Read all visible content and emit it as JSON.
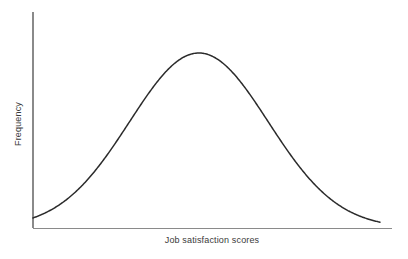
{
  "chart_data": {
    "type": "line",
    "title": "",
    "subtitle": "",
    "xlabel": "Job satisfaction scores",
    "ylabel": "Frequency",
    "annotations": [],
    "legend": [],
    "legend_position": "none",
    "grid": false,
    "xticks": [],
    "yticks": [],
    "xtick_labels": [],
    "ytick_labels": [],
    "xlim": [
      0,
      1
    ],
    "ylim": [
      0,
      1
    ],
    "distribution": "normal",
    "mean": 0.478,
    "stdev": 0.2,
    "peak_value": 1.0,
    "curve_color": "#2b2b2b",
    "axis_color": "#8a8a8a",
    "background_color": "#ffffff",
    "x": [
      0.0,
      0.04,
      0.08,
      0.12,
      0.16,
      0.2,
      0.24,
      0.28,
      0.32,
      0.36,
      0.4,
      0.44,
      0.48,
      0.52,
      0.56,
      0.6,
      0.64,
      0.68,
      0.72,
      0.76,
      0.8,
      0.84,
      0.88,
      0.92,
      0.96,
      1.0
    ],
    "y": [
      0.008,
      0.018,
      0.038,
      0.073,
      0.129,
      0.211,
      0.32,
      0.449,
      0.583,
      0.707,
      0.834,
      0.939,
      0.998,
      0.994,
      0.929,
      0.818,
      0.681,
      0.538,
      0.403,
      0.286,
      0.192,
      0.122,
      0.073,
      0.041,
      0.022,
      0.011
    ]
  },
  "labels": {
    "x_axis": "Job satisfaction scores",
    "y_axis": "Frequency"
  },
  "geometry": {
    "origin_x": 33,
    "origin_y": 228,
    "axis_top_y": 12,
    "axis_right_x": 392,
    "peak_x": 204,
    "peak_y": 53
  }
}
